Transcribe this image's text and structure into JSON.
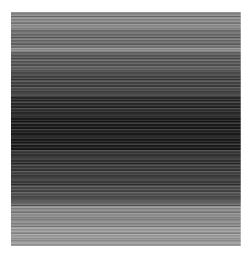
{
  "image": {
    "description": "Grayscale horizontal stripe texture",
    "bands": [
      {
        "top": 0,
        "height": 18,
        "color": "#8a8a8a"
      },
      {
        "top": 18,
        "height": 18,
        "color": "#6e6e6e"
      },
      {
        "top": 36,
        "height": 4,
        "color": "#959595"
      },
      {
        "top": 40,
        "height": 20,
        "color": "#5a5a5a"
      },
      {
        "top": 60,
        "height": 24,
        "color": "#444444"
      },
      {
        "top": 84,
        "height": 20,
        "color": "#2a2a2a"
      },
      {
        "top": 104,
        "height": 34,
        "color": "#1c1c1c"
      },
      {
        "top": 138,
        "height": 16,
        "color": "#333333"
      },
      {
        "top": 154,
        "height": 20,
        "color": "#3c3c3c"
      },
      {
        "top": 174,
        "height": 16,
        "color": "#4c4c4c"
      },
      {
        "top": 190,
        "height": 4,
        "color": "#6a6a6a"
      },
      {
        "top": 194,
        "height": 20,
        "color": "#8c8c8c"
      },
      {
        "top": 214,
        "height": 20,
        "color": "#9c9c9c"
      }
    ]
  }
}
